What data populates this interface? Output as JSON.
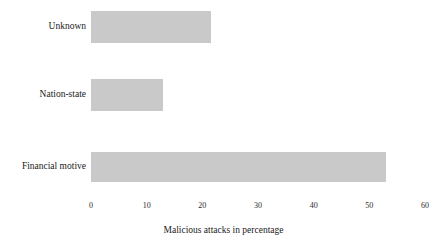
{
  "chart_data": {
    "type": "bar",
    "orientation": "horizontal",
    "title": "",
    "xlabel": "Malicious attacks in percentage",
    "ylabel": "",
    "categories": [
      "Unknown",
      "Nation-state",
      "Financial motive"
    ],
    "values": [
      21.5,
      13,
      53
    ],
    "xlim": [
      0,
      60
    ],
    "xticks": [
      0,
      10,
      20,
      30,
      40,
      50,
      60
    ],
    "xtick_labels": [
      "0",
      "10",
      "20",
      "30",
      "40",
      "50",
      "60"
    ],
    "grid": false,
    "legend": null,
    "bar_color": "#c9c9c9",
    "background_color": "#ffffff",
    "text_color": "#1a1a1a",
    "series": [
      {
        "name": "Malicious attacks in percentage",
        "values": [
          21.5,
          13,
          53
        ]
      }
    ],
    "bars": [
      {
        "label": "Unknown",
        "value": 21.5
      },
      {
        "label": "Nation-state",
        "value": 13
      },
      {
        "label": "Financial motive",
        "value": 53
      }
    ]
  },
  "layout": {
    "plot_left_px": 91,
    "plot_right_px": 425,
    "bar_geometry": [
      {
        "top": 11,
        "height": 32
      },
      {
        "top": 79,
        "height": 32
      },
      {
        "top": 152,
        "height": 30
      }
    ],
    "label_centers_y": [
      27,
      95,
      167
    ]
  }
}
